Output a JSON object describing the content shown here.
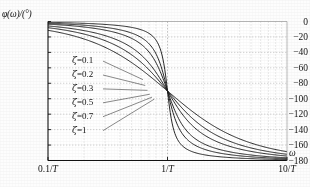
{
  "figure": {
    "caption_y": "φ(ω)/(°)",
    "omega_symbol": "ω",
    "zeta_symbol": "ζ"
  },
  "chart_data": {
    "type": "line",
    "title": "",
    "subtitle": "",
    "xlabel": "ω",
    "ylabel": "φ(ω)/(°)",
    "xscale": "log",
    "xlim": [
      0.1,
      10
    ],
    "ylim": [
      -180,
      0
    ],
    "grid": true,
    "grid_style": "dashed",
    "legend_position": "inline-annotations",
    "xticks": [
      0.1,
      1,
      10
    ],
    "xtick_labels": [
      "0.1/T",
      "1/T",
      "10/T"
    ],
    "yticks": [
      0,
      -20,
      -40,
      -60,
      -80,
      -100,
      -120,
      -140,
      -160,
      -180
    ],
    "ytick_labels": [
      "0",
      "-20",
      "-40",
      "-60",
      "-80",
      "-100",
      "-120",
      "-140",
      "-160",
      "-180"
    ],
    "annotations": [
      {
        "text": "ζ=0.1",
        "x": 0.1,
        "y": -50
      },
      {
        "text": "ζ=0.2",
        "x": 0.1,
        "y": -68
      },
      {
        "text": "ζ=0.3",
        "x": 0.1,
        "y": -86
      },
      {
        "text": "ζ=0.5",
        "x": 0.1,
        "y": -104
      },
      {
        "text": "ζ=0.7",
        "x": 0.1,
        "y": -122
      },
      {
        "text": "ζ=1",
        "x": 0.1,
        "y": -140
      }
    ],
    "series": [
      {
        "name": "ζ=0.1",
        "zeta": 0.1,
        "x": [
          0.1,
          0.13,
          0.16,
          0.2,
          0.25,
          0.32,
          0.4,
          0.5,
          0.63,
          0.79,
          0.9,
          1.0,
          1.12,
          1.26,
          1.58,
          2.0,
          2.5,
          3.16,
          4.0,
          5.0,
          6.3,
          7.9,
          10.0
        ],
        "y": [
          -1.2,
          -1.5,
          -1.9,
          -2.3,
          -3.1,
          -4.1,
          -5.5,
          -7.6,
          -11.4,
          -20.3,
          -31.6,
          -90,
          -148.4,
          -159.7,
          -170.2,
          -173.4,
          -175.3,
          -176.4,
          -177.1,
          -177.7,
          -178.2,
          -178.6,
          -178.8
        ]
      },
      {
        "name": "ζ=0.2",
        "zeta": 0.2,
        "x": [
          0.1,
          0.13,
          0.16,
          0.2,
          0.25,
          0.32,
          0.4,
          0.5,
          0.63,
          0.79,
          0.9,
          1.0,
          1.12,
          1.26,
          1.58,
          2.0,
          2.5,
          3.16,
          4.0,
          5.0,
          6.3,
          7.9,
          10.0
        ],
        "y": [
          -2.3,
          -3.0,
          -3.7,
          -4.7,
          -6.1,
          -8.2,
          -11.0,
          -15.0,
          -22.1,
          -36.2,
          -51.8,
          -90,
          -128.1,
          -143.2,
          -159.0,
          -165.1,
          -168.9,
          -171.5,
          -173.3,
          -174.8,
          -175.9,
          -176.9,
          -177.7
        ]
      },
      {
        "name": "ζ=0.3",
        "zeta": 0.3,
        "x": [
          0.1,
          0.13,
          0.16,
          0.2,
          0.25,
          0.32,
          0.4,
          0.5,
          0.63,
          0.79,
          0.9,
          1.0,
          1.12,
          1.26,
          1.58,
          2.0,
          2.5,
          3.16,
          4.0,
          5.0,
          6.3,
          7.9,
          10.0
        ],
        "y": [
          -3.5,
          -4.5,
          -5.6,
          -7.0,
          -9.2,
          -12.2,
          -16.3,
          -21.8,
          -31.4,
          -48.0,
          -64.1,
          -90,
          -116.0,
          -133.0,
          -151.3,
          -159.4,
          -164.3,
          -167.7,
          -170.1,
          -172.0,
          -173.5,
          -174.8,
          -175.7
        ]
      },
      {
        "name": "ζ=0.5",
        "zeta": 0.5,
        "x": [
          0.1,
          0.13,
          0.16,
          0.2,
          0.25,
          0.32,
          0.4,
          0.5,
          0.63,
          0.79,
          0.9,
          1.0,
          1.12,
          1.26,
          1.58,
          2.0,
          2.5,
          3.16,
          4.0,
          5.0,
          6.3,
          7.9,
          10.0
        ],
        "y": [
          -5.8,
          -7.5,
          -9.2,
          -11.8,
          -15.2,
          -20.1,
          -26.6,
          -34.9,
          -47.8,
          -66.4,
          -79.1,
          -90,
          -104.3,
          -119.1,
          -139.0,
          -149.9,
          -156.7,
          -161.4,
          -164.7,
          -167.3,
          -169.4,
          -171.1,
          -172.4
        ]
      },
      {
        "name": "ζ=0.7",
        "zeta": 0.7,
        "x": [
          0.1,
          0.13,
          0.16,
          0.2,
          0.25,
          0.32,
          0.4,
          0.5,
          0.63,
          0.79,
          0.9,
          1.0,
          1.12,
          1.26,
          1.58,
          2.0,
          2.5,
          3.16,
          4.0,
          5.0,
          6.3,
          7.9,
          10.0
        ],
        "y": [
          -8.1,
          -10.5,
          -12.9,
          -16.4,
          -21.0,
          -27.5,
          -35.8,
          -46.0,
          -60.3,
          -77.0,
          -86.3,
          -90,
          -107.8,
          -122.6,
          -142.0,
          -152.0,
          -158.2,
          -162.5,
          -165.5,
          -167.9,
          -169.8,
          -171.3,
          -172.6
        ]
      },
      {
        "name": "ζ=1",
        "zeta": 1.0,
        "x": [
          0.1,
          0.13,
          0.16,
          0.2,
          0.25,
          0.32,
          0.4,
          0.5,
          0.63,
          0.79,
          0.9,
          1.0,
          1.12,
          1.26,
          1.58,
          2.0,
          2.5,
          3.16,
          4.0,
          5.0,
          6.3,
          7.9,
          10.0
        ],
        "y": [
          -11.4,
          -14.8,
          -18.2,
          -22.6,
          -28.1,
          -35.5,
          -43.6,
          -53.1,
          -64.8,
          -76.8,
          -83.6,
          -90,
          -96.6,
          -103.6,
          -115.6,
          -126.9,
          -136.2,
          -144.2,
          -151.0,
          -157.4,
          -163.0,
          -168.0,
          -174.0
        ]
      }
    ]
  }
}
